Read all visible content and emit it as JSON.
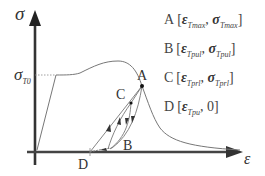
{
  "diagram": {
    "type": "stress-strain hysteresis diagram",
    "axes": {
      "y_label": "σ",
      "x_label": "ε",
      "y_marker": {
        "symbol": "σ",
        "subscript": "T0"
      }
    },
    "points": [
      {
        "id": "A",
        "label": "A"
      },
      {
        "id": "B",
        "label": "B"
      },
      {
        "id": "C",
        "label": "C"
      },
      {
        "id": "D",
        "label": "D"
      }
    ],
    "legend": [
      {
        "point": "A",
        "open": "[",
        "eps": "ε",
        "eps_sub": "Tmax",
        "sep": ",",
        "sig": "σ",
        "sig_sub": "Tmax",
        "close": "]"
      },
      {
        "point": "B",
        "open": "[",
        "eps": "ε",
        "eps_sub": "Tpul",
        "sep": ",",
        "sig": "σ",
        "sig_sub": "Tpul",
        "close": "]"
      },
      {
        "point": "C",
        "open": "[",
        "eps": "ε",
        "eps_sub": "Tprl",
        "sep": ",",
        "sig": "σ",
        "sig_sub": "Tprl",
        "close": "]"
      },
      {
        "point": "D",
        "open": "[",
        "eps": "ε",
        "eps_sub": "Tpu",
        "sep": ",",
        "sig": "0",
        "sig_sub": "",
        "close": "]"
      }
    ],
    "colors": {
      "axis": "#333333",
      "curve": "#777777",
      "text": "#444444"
    }
  }
}
